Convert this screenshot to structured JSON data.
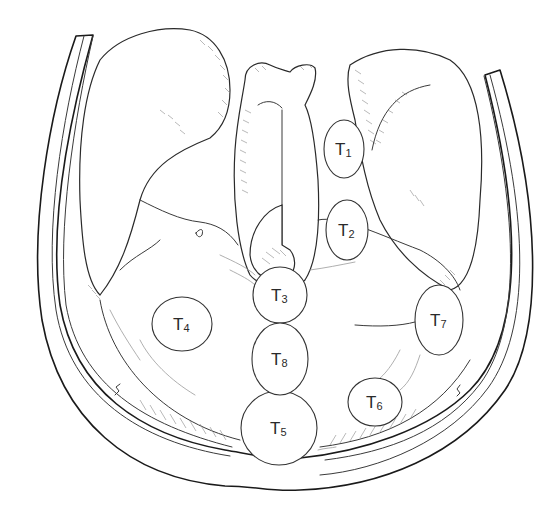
{
  "diagram": {
    "type": "anatomical-illustration",
    "stroke_color": "#1a1a1a",
    "background": "#ffffff"
  },
  "ports": [
    {
      "id": "T1",
      "letter": "T",
      "number": "1",
      "cx": 344,
      "cy": 149,
      "rx": 20,
      "ry": 29
    },
    {
      "id": "T2",
      "letter": "T",
      "number": "2",
      "cx": 347,
      "cy": 230,
      "rx": 21,
      "ry": 30
    },
    {
      "id": "T3",
      "letter": "T",
      "number": "3",
      "cx": 280,
      "cy": 295,
      "rx": 27,
      "ry": 28
    },
    {
      "id": "T4",
      "letter": "T",
      "number": "4",
      "cx": 182,
      "cy": 324,
      "rx": 30,
      "ry": 27
    },
    {
      "id": "T5",
      "letter": "T",
      "number": "5",
      "cx": 279,
      "cy": 428,
      "rx": 38,
      "ry": 37
    },
    {
      "id": "T6",
      "letter": "T",
      "number": "6",
      "cx": 375,
      "cy": 402,
      "rx": 27,
      "ry": 24
    },
    {
      "id": "T7",
      "letter": "T",
      "number": "7",
      "cx": 439,
      "cy": 320,
      "rx": 24,
      "ry": 35
    },
    {
      "id": "T8",
      "letter": "T",
      "number": "8",
      "cx": 280,
      "cy": 359,
      "rx": 28,
      "ry": 36
    }
  ]
}
